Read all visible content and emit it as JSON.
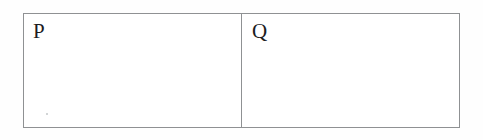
{
  "page": {
    "background_color": "#fefefe",
    "width": 483,
    "height": 140
  },
  "diagram": {
    "type": "two-cell-box",
    "border_color": "#8f9193",
    "cell_background": "#ffffff",
    "text_color": "#1c1c1e",
    "cells": [
      {
        "id": "cell-p",
        "label": "P",
        "artifact": {
          "name": "scan-speck",
          "visible": true,
          "color": "#b9bcbe"
        }
      },
      {
        "id": "cell-q",
        "label": "Q",
        "artifact": {
          "name": "scan-speck",
          "visible": false,
          "color": "#b9bcbe"
        }
      }
    ]
  }
}
